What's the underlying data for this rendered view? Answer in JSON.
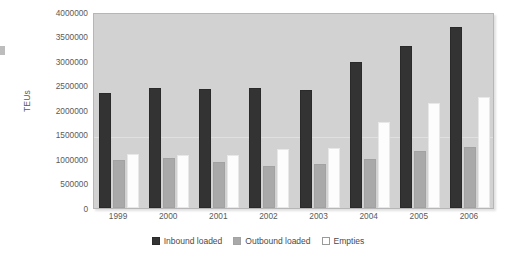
{
  "chart_data": {
    "type": "bar",
    "title": "",
    "subtitle": "",
    "xlabel": "",
    "ylabel": "TEUs",
    "categories": [
      "1999",
      "2000",
      "2001",
      "2002",
      "2003",
      "2004",
      "2005",
      "2006"
    ],
    "ylim": [
      0,
      4000000
    ],
    "ytick_labels": [
      "4000000",
      "3500000",
      "3000000",
      "2500000",
      "2000000",
      "1500000",
      "1000000",
      "500000",
      "0"
    ],
    "ytick_values": [
      4000000,
      3500000,
      3000000,
      2500000,
      2000000,
      1500000,
      1000000,
      500000,
      0
    ],
    "grid": true,
    "legend_position": "bottom",
    "series": [
      {
        "name": "Inbound loaded",
        "color": "#333333",
        "values": [
          2340000,
          2450000,
          2420000,
          2450000,
          2410000,
          2980000,
          3300000,
          3690000
        ]
      },
      {
        "name": "Outbound loaded",
        "color": "#a9a9a9",
        "values": [
          970000,
          1020000,
          930000,
          850000,
          890000,
          1000000,
          1170000,
          1250000
        ]
      },
      {
        "name": "Empties",
        "color": "#ffffff",
        "values": [
          1100000,
          1090000,
          1080000,
          1210000,
          1230000,
          1760000,
          2150000,
          2260000
        ]
      }
    ]
  }
}
